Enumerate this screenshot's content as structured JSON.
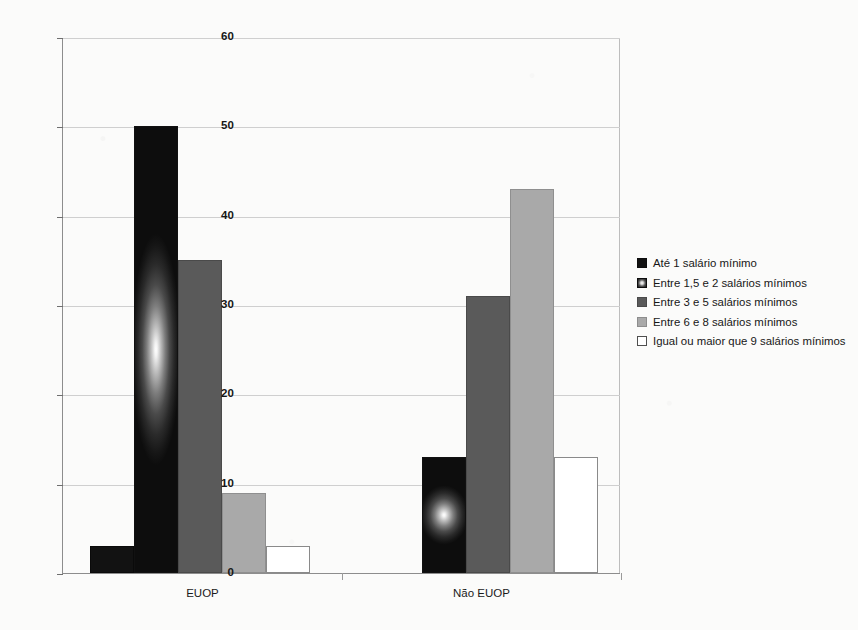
{
  "chart_data": {
    "type": "bar",
    "title": "",
    "subtitle": "",
    "xlabel": "",
    "ylabel": "",
    "categories": [
      "EUOP",
      "Não EUOP"
    ],
    "series": [
      {
        "name": "Até 1 salário mínimo",
        "values": [
          3,
          0
        ],
        "color": "#121212",
        "swatch": "s0"
      },
      {
        "name": "Entre 1,5 e 2 salários mínimos",
        "values": [
          50,
          13
        ],
        "color": "#2a2a2a",
        "swatch": "s1"
      },
      {
        "name": "Entre 3 e 5 salários mínimos",
        "values": [
          35,
          31
        ],
        "color": "#5a5a5a",
        "swatch": "s2"
      },
      {
        "name": "Entre 6 e 8 salários mínimos",
        "values": [
          9,
          43
        ],
        "color": "#a9a9a9",
        "swatch": "s3"
      },
      {
        "name": "Igual ou maior que 9 salários mínimos",
        "values": [
          3,
          13
        ],
        "color": "#ffffff",
        "swatch": "s4"
      }
    ],
    "ylim": [
      0,
      60
    ],
    "yticks": [
      0,
      10,
      20,
      30,
      40,
      50,
      60
    ],
    "ytick_labels": [
      "0",
      "10",
      "20",
      "30",
      "40",
      "50",
      "60"
    ],
    "grid": true,
    "grid_axis": "y",
    "legend_position": "right",
    "bar_gap": 0,
    "group_gap": true,
    "palette": "grayscale"
  },
  "legend": {
    "items": [
      {
        "label": "Até 1 salário mínimo",
        "swatch": "s0"
      },
      {
        "label": "Entre 1,5 e 2 salários mínimos",
        "swatch": "s1"
      },
      {
        "label": "Entre 3 e 5 salários mínimos",
        "swatch": "s2"
      },
      {
        "label": "Entre 6 e 8 salários mínimos",
        "swatch": "s3"
      },
      {
        "label": "Igual ou maior que 9 salários mínimos",
        "swatch": "s4"
      }
    ]
  }
}
